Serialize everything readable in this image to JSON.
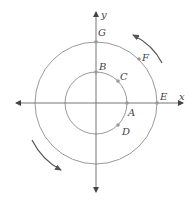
{
  "diagram": {
    "type": "concentric-circles-unit-circle",
    "axes": {
      "x_label": "x",
      "y_label": "y"
    },
    "circles": [
      {
        "name": "inner",
        "points": [
          "A",
          "B",
          "C",
          "D"
        ]
      },
      {
        "name": "outer",
        "points": [
          "E",
          "F",
          "G"
        ]
      }
    ],
    "points": {
      "A": "A",
      "B": "B",
      "C": "C",
      "D": "D",
      "E": "E",
      "F": "F",
      "G": "G"
    },
    "rotation_arrows": [
      {
        "position": "upper-right",
        "direction": "counterclockwise"
      },
      {
        "position": "lower-left",
        "direction": "counterclockwise"
      }
    ],
    "colors": {
      "circle": "#9a9a9a",
      "axis": "#555555",
      "point": "#999999",
      "arrow": "#555555",
      "label": "#444444"
    }
  }
}
